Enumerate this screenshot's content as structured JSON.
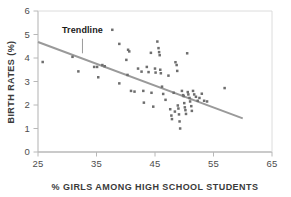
{
  "chart_data": {
    "type": "scatter",
    "title": "",
    "xlabel": "% GIRLS AMONG HIGH SCHOOL STUDENTS",
    "ylabel": "BIRTH RATES (%)",
    "xlim": [
      25,
      65
    ],
    "ylim": [
      0,
      6
    ],
    "xticks": [
      25,
      35,
      45,
      55,
      65
    ],
    "yticks": [
      0,
      1,
      2,
      3,
      4,
      5,
      6
    ],
    "xtick_labels": [
      "25",
      "35",
      "45",
      "55",
      "65"
    ],
    "ytick_labels": [
      "0",
      "1",
      "2",
      "3",
      "4",
      "5",
      "6"
    ],
    "grid": false,
    "legend": "none",
    "point_color": "#6e6e6e",
    "trendline_color": "#9a9a9a",
    "axis_color": "#b3b3b3",
    "annotations": [
      {
        "label": "Trendline",
        "text_x": 32.6,
        "text_y": 5.05,
        "leader_x": 32.6,
        "leader_y_top": 4.82,
        "leader_y_bottom": 4.2
      }
    ],
    "trendline": {
      "x_start": 25.0,
      "y_start": 4.68,
      "x_end": 60.0,
      "y_end": 1.43
    },
    "points": [
      [
        25.8,
        3.83
      ],
      [
        30.9,
        4.05
      ],
      [
        31.9,
        3.43
      ],
      [
        34.6,
        3.62
      ],
      [
        35.1,
        3.62
      ],
      [
        35.3,
        3.18
      ],
      [
        36.0,
        3.7
      ],
      [
        36.4,
        3.65
      ],
      [
        37.7,
        5.2
      ],
      [
        38.9,
        4.6
      ],
      [
        38.9,
        2.92
      ],
      [
        40.1,
        3.92
      ],
      [
        40.4,
        4.35
      ],
      [
        40.6,
        4.28
      ],
      [
        40.3,
        3.28
      ],
      [
        40.9,
        2.6
      ],
      [
        41.5,
        2.57
      ],
      [
        42.1,
        3.55
      ],
      [
        42.7,
        3.42
      ],
      [
        43.0,
        2.6
      ],
      [
        43.1,
        2.1
      ],
      [
        43.6,
        3.62
      ],
      [
        43.9,
        3.4
      ],
      [
        44.3,
        4.22
      ],
      [
        44.4,
        2.52
      ],
      [
        44.7,
        1.93
      ],
      [
        45.0,
        3.55
      ],
      [
        45.1,
        3.38
      ],
      [
        45.4,
        4.7
      ],
      [
        45.6,
        4.42
      ],
      [
        45.7,
        4.25
      ],
      [
        45.8,
        4.12
      ],
      [
        45.9,
        3.5
      ],
      [
        46.0,
        3.35
      ],
      [
        46.2,
        2.78
      ],
      [
        46.4,
        2.47
      ],
      [
        46.8,
        2.22
      ],
      [
        47.3,
        3.25
      ],
      [
        47.6,
        1.82
      ],
      [
        47.8,
        1.55
      ],
      [
        47.9,
        1.4
      ],
      [
        48.2,
        2.52
      ],
      [
        48.4,
        1.72
      ],
      [
        48.5,
        3.82
      ],
      [
        48.7,
        3.7
      ],
      [
        48.8,
        3.45
      ],
      [
        48.9,
        1.98
      ],
      [
        49.0,
        1.85
      ],
      [
        49.1,
        1.6
      ],
      [
        49.2,
        1.3
      ],
      [
        49.3,
        1.0
      ],
      [
        49.6,
        2.6
      ],
      [
        49.8,
        2.42
      ],
      [
        49.9,
        2.38
      ],
      [
        50.0,
        2.08
      ],
      [
        50.1,
        1.9
      ],
      [
        50.2,
        1.78
      ],
      [
        50.3,
        1.62
      ],
      [
        50.5,
        4.2
      ],
      [
        50.6,
        2.55
      ],
      [
        50.7,
        2.45
      ],
      [
        50.9,
        2.3
      ],
      [
        51.0,
        2.15
      ],
      [
        51.2,
        1.95
      ],
      [
        51.3,
        1.75
      ],
      [
        51.5,
        2.6
      ],
      [
        51.7,
        2.45
      ],
      [
        52.0,
        2.35
      ],
      [
        52.3,
        2.18
      ],
      [
        52.6,
        2.3
      ],
      [
        53.0,
        2.48
      ],
      [
        53.4,
        2.18
      ],
      [
        53.9,
        2.15
      ],
      [
        56.9,
        2.72
      ]
    ]
  }
}
